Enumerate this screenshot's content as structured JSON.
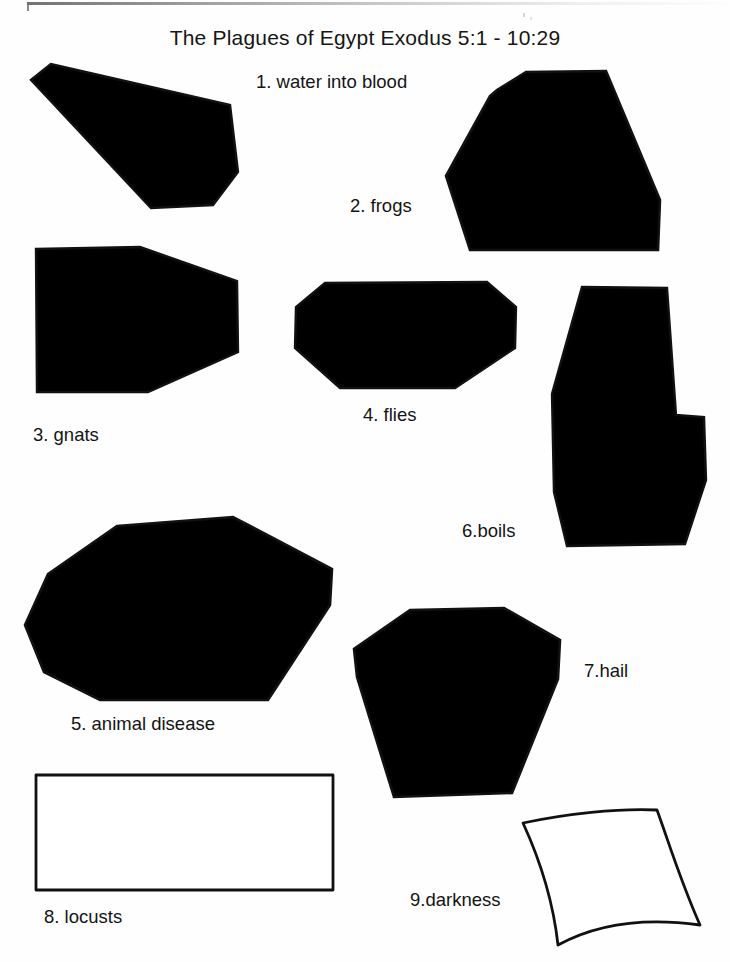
{
  "document": {
    "title": "The Plagues of Egypt Exodus 5:1 - 10:29",
    "page_background": "#ffffff",
    "ink_color": "#111111"
  },
  "shapes": [
    {
      "number": "1",
      "label": "1. water into blood",
      "label_x": 256,
      "label_y": 71,
      "kind": "polygon",
      "points": "51,64 31,80 151,208 213,205 238,172 230,105",
      "stroke_width": 2.4
    },
    {
      "number": "2",
      "label": "2. frogs",
      "label_x": 350,
      "label_y": 195,
      "kind": "polygon",
      "points": "526,72 606,71 660,200 658,250 470,250 446,176 490,96 497,90",
      "stroke_width": 2.6
    },
    {
      "number": "3",
      "label": "3. gnats",
      "label_x": 33,
      "label_y": 424,
      "kind": "polygon",
      "points": "36,249 140,247 237,281 238,352 148,392 37,392",
      "stroke_width": 2.4
    },
    {
      "number": "4",
      "label": "4. flies",
      "label_x": 363,
      "label_y": 404,
      "kind": "polygon",
      "points": "325,283 487,282 516,307 515,348 455,388 340,388 295,348 296,307",
      "stroke_width": 2.4
    },
    {
      "number": "5",
      "label": "5. animal disease",
      "label_x": 71,
      "label_y": 713,
      "kind": "polygon",
      "points": "117,526 233,517 332,569 330,605 268,700 100,700 44,672 25,625 48,574",
      "stroke_width": 2.6
    },
    {
      "number": "6",
      "label": "6.boils",
      "label_x": 462,
      "label_y": 520,
      "kind": "polygon",
      "points": "582,287 667,288 676,415 704,417 706,480 685,544 567,546 554,492 552,394",
      "stroke_width": 2.4
    },
    {
      "number": "7",
      "label": "7.hail",
      "label_x": 584,
      "label_y": 660,
      "kind": "polygon",
      "points": "410,610 504,608 560,640 558,679 512,793 394,797 357,677 354,649",
      "stroke_width": 2.6
    },
    {
      "number": "8",
      "label": "8. locusts",
      "label_x": 44,
      "label_y": 906,
      "kind": "rectangle",
      "x": 36,
      "y": 775,
      "width": 297,
      "height": 115,
      "stroke_width": 2.8
    },
    {
      "number": "9",
      "label": "9.darkness",
      "label_x": 410,
      "label_y": 889,
      "kind": "curved-quad",
      "path": "M523,823 C565,814 618,808 657,810 C668,840 680,880 700,925 C650,918 600,922 558,945 C553,900 540,860 523,823 Z",
      "stroke_width": 2.8
    }
  ]
}
